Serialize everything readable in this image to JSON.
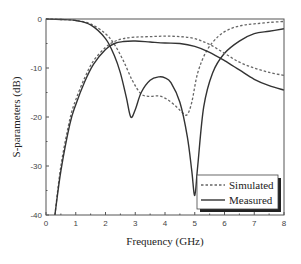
{
  "chart_data": {
    "type": "line",
    "title": "",
    "xlabel": "Frequency (GHz)",
    "ylabel": "S-parameters (dB)",
    "xlim": [
      0,
      8
    ],
    "ylim": [
      -40,
      0
    ],
    "xticks": [
      0,
      1,
      2,
      3,
      4,
      5,
      6,
      7,
      8
    ],
    "yticks": [
      0,
      -10,
      -20,
      -30,
      -40
    ],
    "grid": false,
    "legend_position": "lower right",
    "legend": [
      {
        "label": "Simulated",
        "style": "dashed"
      },
      {
        "label": "Measured",
        "style": "solid"
      }
    ],
    "series": [
      {
        "name": "Simulated S11",
        "style": "dashed",
        "color": "#666666",
        "x": [
          0,
          0.5,
          1.0,
          1.5,
          2.0,
          2.3,
          2.6,
          2.9,
          3.2,
          3.5,
          3.8,
          4.1,
          4.4,
          4.6,
          4.75,
          4.9,
          5.1,
          5.4,
          5.8,
          6.2,
          6.6,
          7.0,
          7.5,
          8.0
        ],
        "y": [
          0,
          -0.1,
          -0.3,
          -1.0,
          -3.0,
          -5.2,
          -8.5,
          -12.5,
          -15.3,
          -15.8,
          -15.7,
          -16.5,
          -18.0,
          -19.2,
          -19.5,
          -17.0,
          -11.0,
          -6.5,
          -3.5,
          -2.0,
          -1.3,
          -1.0,
          -0.7,
          -0.5
        ]
      },
      {
        "name": "Measured S11",
        "style": "solid",
        "color": "#333333",
        "x": [
          0,
          0.5,
          1.0,
          1.5,
          2.0,
          2.3,
          2.5,
          2.7,
          2.85,
          3.0,
          3.2,
          3.5,
          3.8,
          4.0,
          4.2,
          4.5,
          4.75,
          4.9,
          5.0,
          5.1,
          5.3,
          5.6,
          6.0,
          6.5,
          7.0,
          7.5,
          8.0
        ],
        "y": [
          0,
          -0.1,
          -0.3,
          -1.2,
          -4.0,
          -7.5,
          -11.0,
          -16.0,
          -20.0,
          -18.5,
          -15.0,
          -12.5,
          -11.8,
          -12.0,
          -13.0,
          -17.0,
          -24.0,
          -31.0,
          -36.0,
          -30.0,
          -18.0,
          -11.0,
          -7.0,
          -4.5,
          -3.0,
          -2.5,
          -2.0
        ]
      },
      {
        "name": "Simulated S21",
        "style": "dashed",
        "color": "#666666",
        "x": [
          0.3,
          0.5,
          0.8,
          1.0,
          1.3,
          1.6,
          2.0,
          2.3,
          2.6,
          3.0,
          3.5,
          4.0,
          4.5,
          5.0,
          5.5,
          6.0,
          6.5,
          7.0,
          7.5,
          8.0
        ],
        "y": [
          -40.0,
          -30.0,
          -20.5,
          -16.5,
          -12.0,
          -8.5,
          -5.8,
          -4.6,
          -4.0,
          -3.7,
          -3.6,
          -3.5,
          -3.6,
          -4.0,
          -5.2,
          -7.0,
          -8.8,
          -10.0,
          -10.9,
          -11.5
        ]
      },
      {
        "name": "Measured S21",
        "style": "solid",
        "color": "#333333",
        "x": [
          0.3,
          0.5,
          0.8,
          1.0,
          1.3,
          1.6,
          2.0,
          2.3,
          2.6,
          3.0,
          3.5,
          4.0,
          4.5,
          5.0,
          5.5,
          6.0,
          6.5,
          7.0,
          7.5,
          8.0
        ],
        "y": [
          -40.0,
          -31.0,
          -21.5,
          -17.5,
          -12.8,
          -9.2,
          -6.2,
          -5.0,
          -4.6,
          -4.5,
          -4.7,
          -4.9,
          -5.0,
          -5.6,
          -6.8,
          -8.5,
          -10.4,
          -12.3,
          -13.6,
          -14.5
        ]
      }
    ]
  }
}
